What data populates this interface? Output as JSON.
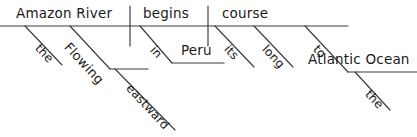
{
  "diagram": {
    "type": "reed-kellogg-sentence-diagram",
    "sentence": "The Amazon River, flowing eastward, begins its long course in Peru to the Atlantic Ocean.",
    "background_color": "#ffffff",
    "ink_color": "#3a3a3a",
    "text_color": "#1a1a1a",
    "nodes": {
      "subject": "Amazon River",
      "subject_article": "the",
      "subject_participle": "Flowing",
      "participle_adverb": "eastward",
      "verb": "begins",
      "verb_preposition": "in",
      "verb_prep_object": "Peru",
      "direct_object": "course",
      "object_possessive": "its",
      "object_adjective": "long",
      "object_preposition": "to",
      "object_prep_object": "Atlantic Ocean",
      "prep_object_article": "the"
    }
  }
}
